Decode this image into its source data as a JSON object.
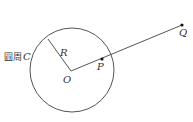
{
  "diagram": {
    "circle_label_prefix": "圓周",
    "circle_label_var": "C",
    "radius_label": "R",
    "center_label": "O",
    "point_p_label": "P",
    "point_q_label": "Q",
    "stroke_color": "#555555",
    "point_color": "#111111"
  }
}
